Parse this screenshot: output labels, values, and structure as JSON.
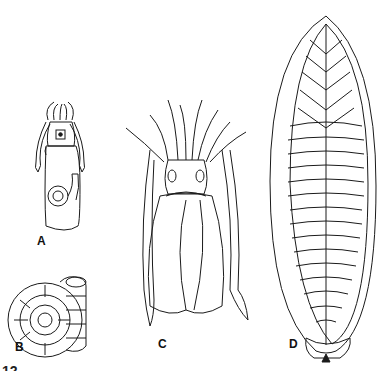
{
  "figure": {
    "panels": [
      {
        "id": "A",
        "label": "A",
        "subject": "small squid-like cephalopod with internal coiled shell"
      },
      {
        "id": "B",
        "label": "B",
        "subject": "loosely coiled chambered shell"
      },
      {
        "id": "C",
        "label": "C",
        "subject": "cuttlefish, dorsal view"
      },
      {
        "id": "D",
        "label": "D",
        "subject": "cuttlebone"
      }
    ],
    "corner_fragment": "12"
  },
  "colors": {
    "ink": "#1a1a1a",
    "background": "#ffffff"
  }
}
